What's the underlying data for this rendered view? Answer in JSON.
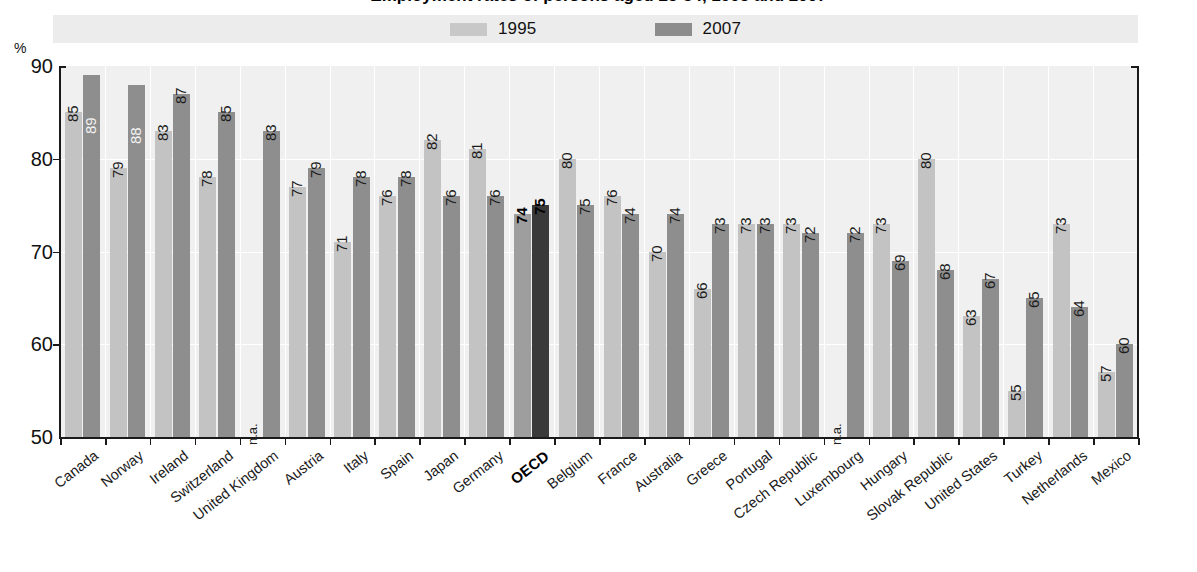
{
  "title": "Employment rates of persons aged 25-54, 1995 and 2007",
  "axis": {
    "unit": "%",
    "yticks": [
      "90",
      "80",
      "70",
      "60",
      "50"
    ],
    "ymin": 50,
    "ymax": 90
  },
  "legend": {
    "items": [
      {
        "label": "1995",
        "color": "#c8c8c8",
        "name": "legend-swatch-1995"
      },
      {
        "label": "2007",
        "color": "#8c8c8c",
        "name": "legend-swatch-2007"
      }
    ]
  },
  "chart_data": {
    "type": "bar",
    "title": "Employment rates of persons aged 25-54, 1995 and 2007",
    "xlabel": "",
    "ylabel": "%",
    "ylim": [
      50,
      90
    ],
    "grid": true,
    "legend_position": "top",
    "categories": [
      "Canada",
      "Norway",
      "Ireland",
      "Switzerland",
      "United Kingdom",
      "Austria",
      "Italy",
      "Spain",
      "Japan",
      "Germany",
      "OECD",
      "Belgium",
      "France",
      "Australia",
      "Greece",
      "Portugal",
      "Czech Republic",
      "Luxembourg",
      "Hungary",
      "Slovak Republic",
      "United States",
      "Turkey",
      "Netherlands",
      "Mexico"
    ],
    "series": [
      {
        "name": "1995",
        "color": "#c3c3c3",
        "values": [
          85,
          79,
          83,
          78,
          null,
          77,
          71,
          76,
          82,
          81,
          74,
          80,
          76,
          70,
          66,
          73,
          73,
          null,
          73,
          80,
          63,
          55,
          73,
          57
        ],
        "labels": [
          "85",
          "79",
          "83",
          "78",
          "n.a.",
          "77",
          "71",
          "76",
          "82",
          "81",
          "74",
          "80",
          "76",
          "70",
          "66",
          "73",
          "73",
          "n.a.",
          "73",
          "80",
          "63",
          "55",
          "73",
          "57"
        ]
      },
      {
        "name": "2007",
        "color": "#8e8e8e",
        "values": [
          89,
          88,
          87,
          85,
          83,
          79,
          78,
          78,
          76,
          76,
          75,
          75,
          74,
          74,
          73,
          73,
          72,
          72,
          69,
          68,
          67,
          65,
          64,
          60
        ],
        "labels": [
          "89",
          "88",
          "87",
          "85",
          "83",
          "79",
          "78",
          "78",
          "76",
          "76",
          "75",
          "75",
          "74",
          "74",
          "73",
          "73",
          "72",
          "72",
          "69",
          "68",
          "67",
          "65",
          "64",
          "60"
        ]
      }
    ],
    "highlight_category": "OECD",
    "highlight_colors": {
      "1995": "#9e9e9e",
      "2007": "#3a3a3a"
    }
  }
}
